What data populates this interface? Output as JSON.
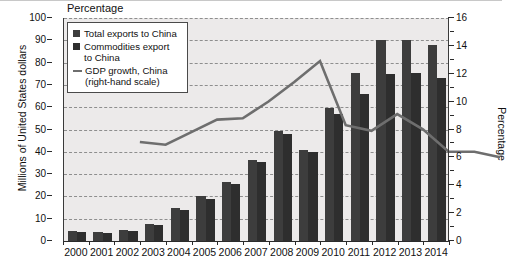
{
  "chart_data": {
    "type": "bar",
    "title": "Percentage",
    "xlabel": "",
    "ylabel": "Millions of United States dollars",
    "y2label": "Percentage",
    "categories": [
      "2000",
      "2001",
      "2002",
      "2003",
      "2004",
      "2005",
      "2006",
      "2007",
      "2008",
      "2009",
      "2010",
      "2011",
      "2012",
      "2013",
      "2014"
    ],
    "ylim": [
      0,
      100
    ],
    "yticks": [
      0,
      10,
      20,
      30,
      40,
      50,
      60,
      70,
      80,
      90,
      100
    ],
    "y2lim": [
      0,
      16
    ],
    "y2ticks": [
      0,
      2,
      4,
      6,
      8,
      10,
      12,
      14,
      16
    ],
    "grid": true,
    "legend_position": "top-left",
    "series": [
      {
        "name": "Total exports to China",
        "axis": "left",
        "type": "bar",
        "color": "#3d3d3d",
        "values": [
          4.5,
          4.0,
          5.0,
          7.5,
          15.0,
          20.0,
          26.5,
          36.5,
          49.5,
          41.0,
          59.5,
          75.5,
          90.0,
          90.0,
          88.0
        ]
      },
      {
        "name": "Commodities export to China",
        "axis": "left",
        "type": "bar",
        "color": "#2e2e2e",
        "values": [
          4.0,
          3.5,
          4.3,
          7.0,
          14.0,
          19.0,
          25.5,
          35.5,
          48.0,
          40.0,
          57.0,
          66.0,
          75.0,
          75.5,
          73.0
        ]
      },
      {
        "name": "GDP growth, China (right-hand scale)",
        "axis": "right",
        "type": "line",
        "color": "#6e6e6e",
        "values": [
          8.4,
          8.2,
          9.1,
          10.0,
          10.1,
          11.3,
          12.7,
          14.2,
          9.6,
          9.2,
          10.4,
          9.3,
          7.7,
          7.7,
          7.3
        ]
      }
    ],
    "legend_entries": [
      "Total exports to China",
      "Commodities export to China",
      "GDP growth, China (right-hand scale)"
    ]
  },
  "legend": {
    "items": [
      {
        "label_line1": "Total exports to China",
        "label_line2": ""
      },
      {
        "label_line1": "Commodities export",
        "label_line2": "to China"
      },
      {
        "label_line1": "GDP growth, China",
        "label_line2": "(right-hand scale)"
      }
    ]
  },
  "axes": {
    "top_title": "Percentage",
    "left_title": "Millions of United States dollars",
    "right_title": "Percentage",
    "left_ticks": [
      "100",
      "90",
      "80",
      "70",
      "60",
      "50",
      "40",
      "30",
      "20",
      "10",
      "0"
    ],
    "right_ticks": [
      "16",
      "14",
      "12",
      "10",
      "8",
      "6",
      "4",
      "2",
      "0"
    ],
    "x_ticks": [
      "2000",
      "2001",
      "2002",
      "2003",
      "2004",
      "2005",
      "2006",
      "2007",
      "2008",
      "2009",
      "2010",
      "2011",
      "2012",
      "2013",
      "2014"
    ]
  }
}
